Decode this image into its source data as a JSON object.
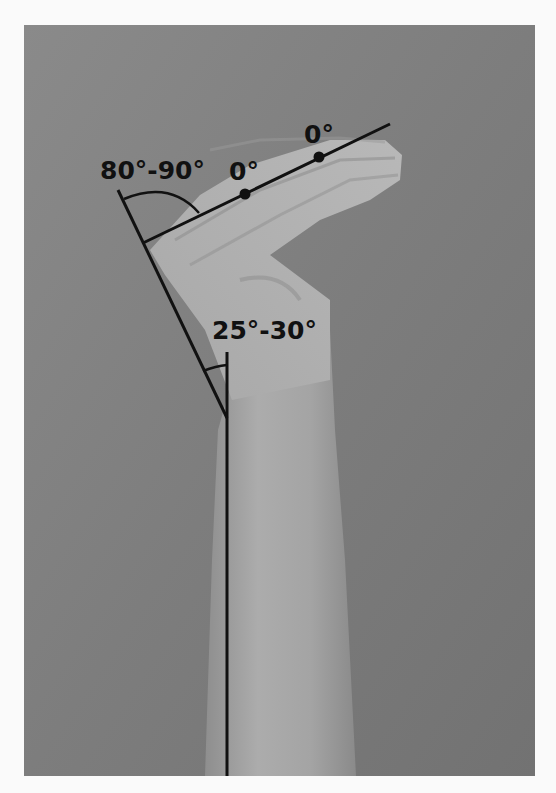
{
  "figure": {
    "background_color": "#8c8c8c",
    "frame_color": "#fafafa",
    "line_color": "#111111",
    "labels": {
      "angle_mcp": "80°-90°",
      "angle_wrist": "25°-30°",
      "joint_pip": "0°",
      "joint_dip": "0°"
    }
  }
}
